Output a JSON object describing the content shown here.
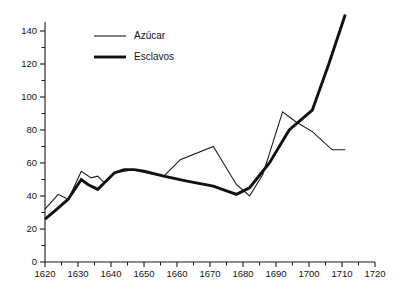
{
  "chart_data": {
    "type": "line",
    "title": "",
    "xlabel": "",
    "ylabel": "",
    "xlim": [
      1620,
      1720
    ],
    "ylim": [
      0,
      148
    ],
    "grid": false,
    "legend_position": "top-left-inside",
    "x_ticks_major": [
      1620,
      1630,
      1640,
      1650,
      1660,
      1670,
      1680,
      1690,
      1700,
      1710,
      1720
    ],
    "x_ticks_minor": [
      1625,
      1635,
      1645,
      1655,
      1665,
      1675,
      1685,
      1695,
      1705,
      1715
    ],
    "y_ticks_major": [
      0,
      20,
      40,
      60,
      80,
      100,
      120,
      140
    ],
    "y_ticks_minor": [
      10,
      30,
      50,
      70,
      90,
      110,
      130
    ],
    "x_tick_labels": [
      "1620",
      "1630",
      "1640",
      "1650",
      "1660",
      "1670",
      "1680",
      "1690",
      "1700",
      "1710",
      "1720"
    ],
    "y_tick_labels": [
      "0",
      "20",
      "40",
      "60",
      "80",
      "100",
      "120",
      "140"
    ],
    "series": [
      {
        "name": "Azúcar",
        "style": "thin",
        "x": [
          1620,
          1624,
          1627,
          1628,
          1631,
          1634,
          1636,
          1638,
          1641,
          1644,
          1647,
          1651,
          1656,
          1661,
          1671,
          1678,
          1682,
          1686,
          1692,
          1696,
          1701,
          1707,
          1711
        ],
        "values": [
          32,
          41,
          38,
          42,
          55,
          51,
          52,
          48,
          54,
          55,
          56,
          54,
          52,
          62,
          70,
          47,
          40,
          53,
          91,
          85,
          79,
          68,
          68
        ]
      },
      {
        "name": "Esclavos",
        "style": "thick",
        "x": [
          1620,
          1623,
          1627,
          1631,
          1633,
          1636,
          1638,
          1641,
          1644,
          1647,
          1650,
          1656,
          1663,
          1671,
          1678,
          1682,
          1688,
          1694,
          1701,
          1706,
          1711
        ],
        "values": [
          26,
          31,
          38,
          50,
          47,
          44,
          48,
          54,
          56,
          56,
          55,
          52,
          49,
          46,
          41,
          45,
          60,
          80,
          92,
          120,
          150
        ]
      }
    ],
    "legend": [
      {
        "label": "Azúcar",
        "style": "thin"
      },
      {
        "label": "Esclavos",
        "style": "thick"
      }
    ]
  },
  "geometry": {
    "plot_left": 45,
    "plot_bottom": 262,
    "plot_right": 375,
    "plot_top": 22,
    "legend_x": 94,
    "legend_y_azucar": 36,
    "legend_y_esclavos": 57
  }
}
